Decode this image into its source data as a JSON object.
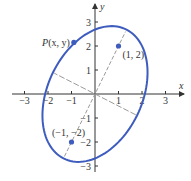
{
  "diagram": {
    "type": "rotated-ellipse",
    "x_axis_label": "x",
    "y_axis_label": "y",
    "x_ticks": [
      -3,
      -2,
      -1,
      1,
      2,
      3
    ],
    "y_ticks": [
      -3,
      -2,
      -1,
      1,
      2,
      3
    ],
    "x_tick_labels": [
      "−3",
      "−2",
      "−1",
      "1",
      "2",
      "3"
    ],
    "y_tick_labels": [
      "−3",
      "−2",
      "−1",
      "1",
      "2",
      "3"
    ],
    "ellipse": {
      "center": [
        0,
        0
      ],
      "semi_major": 3,
      "semi_minor": 2,
      "major_axis_direction": [
        1,
        2
      ]
    },
    "points": [
      {
        "name": "P",
        "label": "P(x, y)",
        "x": -0.9,
        "y": 2.15
      },
      {
        "name": "focus-1",
        "label": "(1, 2)",
        "x": 1,
        "y": 2
      },
      {
        "name": "focus-2",
        "label": "(−1, −2)",
        "x": -1,
        "y": -2
      }
    ],
    "colors": {
      "curve": "#3d5cbd",
      "point": "#3d5cbd",
      "axis": "#333333",
      "dashed": "#9a9a9a"
    }
  }
}
